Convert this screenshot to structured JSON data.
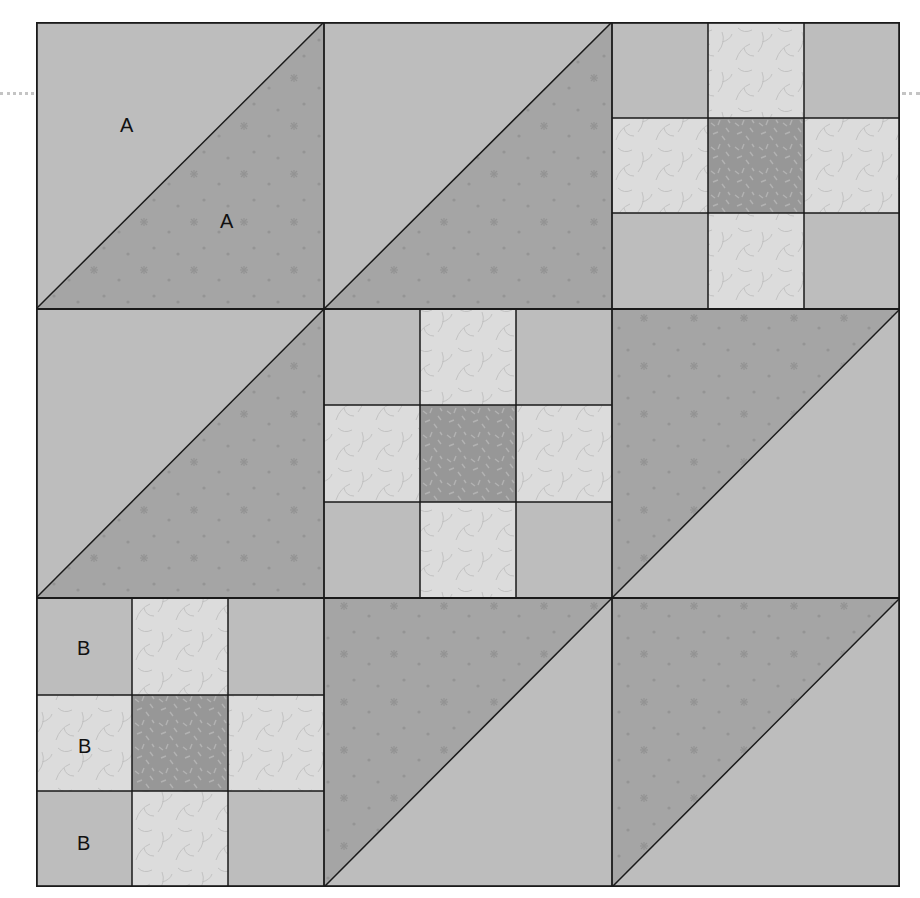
{
  "diagram": {
    "colors": {
      "background_light": "#bdbdbd",
      "triangle_dark": "#a5a5a5",
      "print_light": "#dcdcdc",
      "center_dark": "#979797",
      "seam": "#1a1a1a",
      "guide_dots": "#c4c4c4"
    },
    "grid": {
      "rows": 3,
      "cols": 3
    },
    "blocks": [
      {
        "row": 0,
        "col": 0,
        "type": "half-square-triangle",
        "dark": "bottom-right",
        "labels": [
          "A",
          "A"
        ]
      },
      {
        "row": 0,
        "col": 1,
        "type": "half-square-triangle",
        "dark": "bottom-right",
        "labels": []
      },
      {
        "row": 0,
        "col": 2,
        "type": "nine-patch",
        "labels": []
      },
      {
        "row": 1,
        "col": 0,
        "type": "half-square-triangle",
        "dark": "bottom-right",
        "labels": []
      },
      {
        "row": 1,
        "col": 1,
        "type": "nine-patch",
        "labels": []
      },
      {
        "row": 1,
        "col": 2,
        "type": "half-square-triangle",
        "dark": "top-left",
        "labels": []
      },
      {
        "row": 2,
        "col": 0,
        "type": "nine-patch",
        "labels": [
          "B",
          "B",
          "B"
        ]
      },
      {
        "row": 2,
        "col": 1,
        "type": "half-square-triangle",
        "dark": "top-left",
        "labels": []
      },
      {
        "row": 2,
        "col": 2,
        "type": "half-square-triangle",
        "dark": "top-left",
        "labels": []
      }
    ],
    "labels": {
      "a_light": "A",
      "a_dark": "A",
      "b_top": "B",
      "b_middle": "B",
      "b_bottom": "B"
    }
  }
}
